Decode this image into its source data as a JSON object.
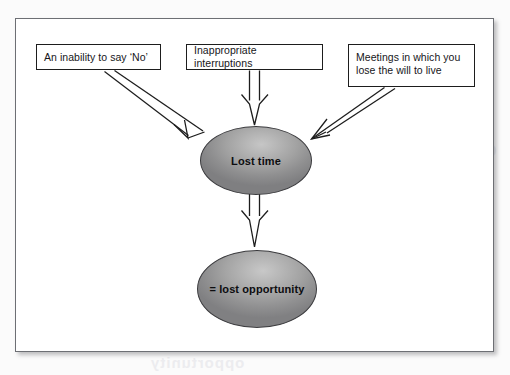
{
  "figure": {
    "type": "flow-diagram",
    "background_color": "#ffffff",
    "frame_border_color": "#6d6f74",
    "node_fill_dark": "#7f7f81",
    "node_fill_light": "#c6c6c6",
    "arrow_stroke_color": "#1d1d1d"
  },
  "boxes": [
    {
      "id": "inability",
      "label": "An inability to say ‘No’"
    },
    {
      "id": "interruptions",
      "label": "Inappropriate interruptions"
    },
    {
      "id": "meetings",
      "label": "Meetings in which you lose the will to live"
    }
  ],
  "nodes": [
    {
      "id": "lost-time",
      "label": "Lost time"
    },
    {
      "id": "lost-opportunity",
      "label": "= lost opportunity"
    }
  ],
  "arrows": [
    {
      "id": "arrow-inability-to-lost-time",
      "from": "inability",
      "to": "lost-time",
      "style": "hollow-block"
    },
    {
      "id": "arrow-interruptions-to-lost-time",
      "from": "interruptions",
      "to": "lost-time",
      "style": "hollow-block"
    },
    {
      "id": "arrow-meetings-to-lost-time",
      "from": "meetings",
      "to": "lost-time",
      "style": "hollow-block"
    },
    {
      "id": "arrow-lost-time-to-opportunity",
      "from": "lost-time",
      "to": "lost-opportunity",
      "style": "hollow-block"
    }
  ],
  "bleed_through": {
    "right": "Overview",
    "middle": "lost time",
    "bottom": "opportunity"
  }
}
